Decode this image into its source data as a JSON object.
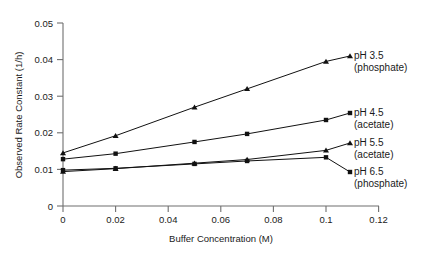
{
  "chart_data": {
    "type": "line",
    "title": "",
    "xlabel": "Buffer Concentration (M)",
    "ylabel": "Observed Rate Constant (1/h)",
    "xlim": [
      0,
      0.12
    ],
    "ylim": [
      0,
      0.05
    ],
    "xticks": [
      0,
      0.02,
      0.04,
      0.06,
      0.08,
      0.1,
      0.12
    ],
    "xticklabels": [
      "0",
      "0.02",
      "0.04",
      "0.06",
      "0.08",
      "0.1",
      "0.12"
    ],
    "yticks": [
      0,
      0.01,
      0.02,
      0.03,
      0.04,
      0.05
    ],
    "yticklabels": [
      "0",
      "0.01",
      "0.02",
      "0.03",
      "0.04",
      "0.05"
    ],
    "grid": false,
    "legend_position": "right-inline-annotations",
    "x": [
      0,
      0.02,
      0.05,
      0.07,
      0.1
    ],
    "series": [
      {
        "name": "pH 3.5 (phosphate)",
        "label_line1": "pH 3.5",
        "label_line2": "(phosphate)",
        "marker": "triangle",
        "color": "#111111",
        "values": [
          0.0145,
          0.0192,
          0.027,
          0.032,
          0.0395
        ]
      },
      {
        "name": "pH 4.5 (acetate)",
        "label_line1": "pH 4.5",
        "label_line2": "(acetate)",
        "marker": "square",
        "color": "#111111",
        "values": [
          0.0128,
          0.0143,
          0.0175,
          0.0197,
          0.0235
        ]
      },
      {
        "name": "pH 5.5 (acetate)",
        "label_line1": "pH 5.5",
        "label_line2": "(acetate)",
        "marker": "triangle",
        "color": "#111111",
        "values": [
          0.0094,
          0.0102,
          0.0117,
          0.0127,
          0.0152
        ]
      },
      {
        "name": "pH 6.5 (phosphate)",
        "label_line1": "pH 6.5",
        "label_line2": "(phosphate)",
        "marker": "square",
        "color": "#111111",
        "values": [
          0.0098,
          0.0103,
          0.0115,
          0.0123,
          0.0133
        ]
      }
    ]
  },
  "axes": {
    "y_title": "Observed Rate Constant (1/h)",
    "x_title": "Buffer Concentration (M)",
    "y_labels": {
      "t0": "0",
      "t1": "0.01",
      "t2": "0.02",
      "t3": "0.03",
      "t4": "0.04",
      "t5": "0.05"
    },
    "x_labels": {
      "t0": "0",
      "t1": "0.02",
      "t2": "0.04",
      "t3": "0.06",
      "t4": "0.08",
      "t5": "0.1",
      "t6": "0.12"
    }
  },
  "annotations": {
    "ph35_l1": "pH 3.5",
    "ph35_l2": "(phosphate)",
    "ph45_l1": "pH 4.5",
    "ph45_l2": "(acetate)",
    "ph55_l1": "pH 5.5",
    "ph55_l2": "(acetate)",
    "ph65_l1": "pH 6.5",
    "ph65_l2": "(phosphate)"
  },
  "colors": {
    "ink": "#111111",
    "axis": "#6f6f6f",
    "background": "#ffffff"
  }
}
